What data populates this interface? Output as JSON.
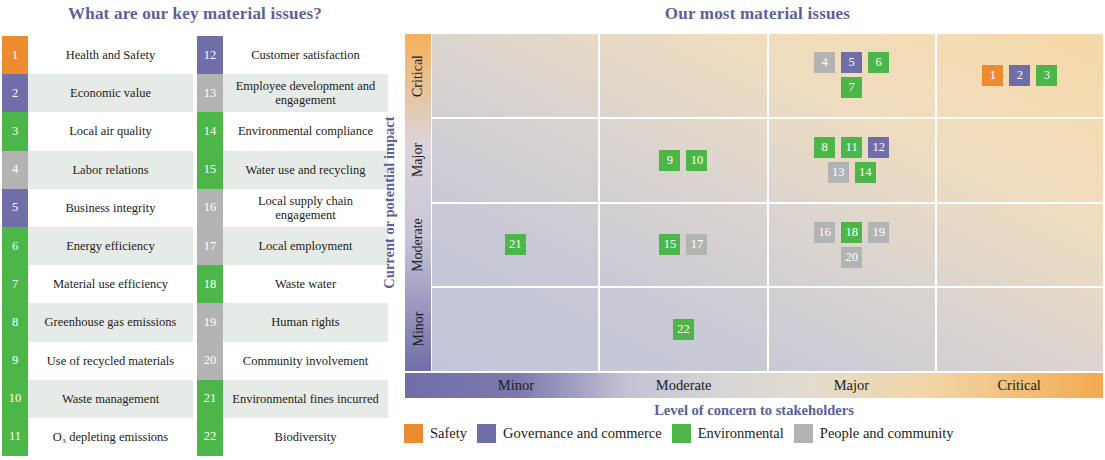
{
  "headings": {
    "left": "What are our key material issues?",
    "right": "Our most material issues"
  },
  "categories": {
    "safety": "Safety",
    "governance": "Governance and commerce",
    "environmental": "Environmental",
    "people": "People and community"
  },
  "colors": {
    "safety": "#ec8b2f",
    "governance": "#6f6ea8",
    "environmental": "#4cb748",
    "people": "#b3b3b3",
    "heading_text": "#5b5f9e"
  },
  "issues_left": [
    {
      "num": "1",
      "label": "Health and Safety",
      "category": "safety"
    },
    {
      "num": "2",
      "label": "Economic value",
      "category": "governance"
    },
    {
      "num": "3",
      "label": "Local air quality",
      "category": "environmental"
    },
    {
      "num": "4",
      "label": "Labor relations",
      "category": "people"
    },
    {
      "num": "5",
      "label": "Business integrity",
      "category": "governance"
    },
    {
      "num": "6",
      "label": "Energy efficiency",
      "category": "environmental"
    },
    {
      "num": "7",
      "label": "Material use efficiency",
      "category": "environmental"
    },
    {
      "num": "8",
      "label": "Greenhouse gas emissions",
      "category": "environmental"
    },
    {
      "num": "9",
      "label": "Use of recycled materials",
      "category": "environmental"
    },
    {
      "num": "10",
      "label": "Waste management",
      "category": "environmental"
    },
    {
      "num": "11",
      "label": "O₃ depleting emissions",
      "category": "environmental"
    }
  ],
  "issues_right": [
    {
      "num": "12",
      "label": "Customer satisfaction",
      "category": "governance"
    },
    {
      "num": "13",
      "label": "Employee development and engagement",
      "category": "people"
    },
    {
      "num": "14",
      "label": "Environmental compliance",
      "category": "environmental"
    },
    {
      "num": "15",
      "label": "Water use and recycling",
      "category": "environmental"
    },
    {
      "num": "16",
      "label": "Local supply chain engagement",
      "category": "people"
    },
    {
      "num": "17",
      "label": "Local employment",
      "category": "people"
    },
    {
      "num": "18",
      "label": "Waste water",
      "category": "environmental"
    },
    {
      "num": "19",
      "label": "Human rights",
      "category": "people"
    },
    {
      "num": "20",
      "label": "Community involvement",
      "category": "people"
    },
    {
      "num": "21",
      "label": "Environmental fines incurred",
      "category": "environmental"
    },
    {
      "num": "22",
      "label": "Biodiversity",
      "category": "environmental"
    }
  ],
  "chart_data": {
    "type": "heatmap",
    "title": "Our most material issues",
    "xlabel": "Level of concern to stakeholders",
    "ylabel": "Current or potential impact",
    "x_categories": [
      "Minor",
      "Moderate",
      "Major",
      "Critical"
    ],
    "y_categories": [
      "Critical",
      "Major",
      "Moderate",
      "Minor"
    ],
    "grid": true,
    "legend_position": "bottom",
    "cells": [
      {
        "y": "Critical",
        "x": "Minor",
        "items": []
      },
      {
        "y": "Critical",
        "x": "Moderate",
        "items": []
      },
      {
        "y": "Critical",
        "x": "Major",
        "items": [
          {
            "num": "4",
            "category": "people"
          },
          {
            "num": "5",
            "category": "governance"
          },
          {
            "num": "6",
            "category": "environmental"
          },
          {
            "num": "7",
            "category": "environmental"
          }
        ]
      },
      {
        "y": "Critical",
        "x": "Critical",
        "items": [
          {
            "num": "1",
            "category": "safety"
          },
          {
            "num": "2",
            "category": "governance"
          },
          {
            "num": "3",
            "category": "environmental"
          }
        ]
      },
      {
        "y": "Major",
        "x": "Minor",
        "items": []
      },
      {
        "y": "Major",
        "x": "Moderate",
        "items": [
          {
            "num": "9",
            "category": "environmental"
          },
          {
            "num": "10",
            "category": "environmental"
          }
        ]
      },
      {
        "y": "Major",
        "x": "Major",
        "items": [
          {
            "num": "8",
            "category": "environmental"
          },
          {
            "num": "11",
            "category": "environmental"
          },
          {
            "num": "12",
            "category": "governance"
          },
          {
            "num": "13",
            "category": "people"
          },
          {
            "num": "14",
            "category": "environmental"
          }
        ]
      },
      {
        "y": "Major",
        "x": "Critical",
        "items": []
      },
      {
        "y": "Moderate",
        "x": "Minor",
        "items": [
          {
            "num": "21",
            "category": "environmental"
          }
        ]
      },
      {
        "y": "Moderate",
        "x": "Moderate",
        "items": [
          {
            "num": "15",
            "category": "environmental"
          },
          {
            "num": "17",
            "category": "people"
          }
        ]
      },
      {
        "y": "Moderate",
        "x": "Major",
        "items": [
          {
            "num": "16",
            "category": "people"
          },
          {
            "num": "18",
            "category": "environmental"
          },
          {
            "num": "19",
            "category": "people"
          },
          {
            "num": "20",
            "category": "people"
          }
        ]
      },
      {
        "y": "Moderate",
        "x": "Critical",
        "items": []
      },
      {
        "y": "Minor",
        "x": "Minor",
        "items": []
      },
      {
        "y": "Minor",
        "x": "Moderate",
        "items": [
          {
            "num": "22",
            "category": "environmental"
          }
        ]
      },
      {
        "y": "Minor",
        "x": "Major",
        "items": []
      },
      {
        "y": "Minor",
        "x": "Critical",
        "items": []
      }
    ]
  }
}
